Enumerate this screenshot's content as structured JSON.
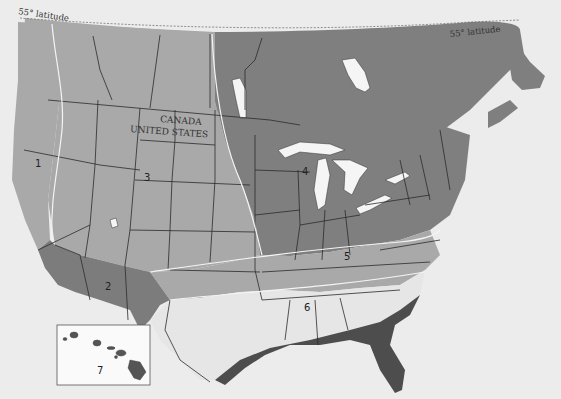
{
  "map": {
    "title": "Zone map of the United States and southern Canada",
    "labels": {
      "latitude_left": "55° latitude",
      "latitude_right": "55° latitude",
      "canada": "CANADA",
      "united_states": "UNITED STATES"
    },
    "zones": [
      {
        "id": "1",
        "label": "1",
        "region": "Pacific coast",
        "shade": "#a9a9a9"
      },
      {
        "id": "2",
        "label": "2",
        "region": "Desert Southwest",
        "shade": "#7c7c7c"
      },
      {
        "id": "3",
        "label": "3",
        "region": "Intermountain / Plains",
        "shade": "#a9a9a9"
      },
      {
        "id": "4",
        "label": "4",
        "region": "Upper Midwest / Northeast / Canada",
        "shade": "#7f7f7f"
      },
      {
        "id": "5",
        "label": "5",
        "region": "Mid-South",
        "shade": "#a9a9a9"
      },
      {
        "id": "6",
        "label": "6",
        "region": "Southeast interior",
        "shade": "#e6e6e6"
      },
      {
        "id": "7",
        "label": "7",
        "region": "Hawaii (inset)",
        "shade": "#fafafa"
      }
    ],
    "colors": {
      "background": "#ececec",
      "gulf_coast_zone": "#4d4d4d",
      "zone_boundary": "#f4f4f4",
      "state_border": "#2b2b2b"
    }
  }
}
